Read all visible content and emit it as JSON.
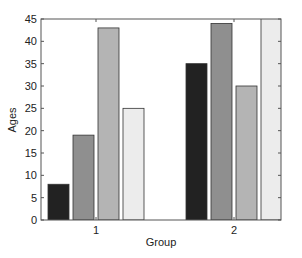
{
  "chart_data": {
    "type": "bar",
    "title": "",
    "xlabel": "Group",
    "ylabel": "Ages",
    "categories": [
      "1",
      "2"
    ],
    "series": [
      {
        "name": "Series 1",
        "values": [
          8,
          35
        ],
        "color": "#222222"
      },
      {
        "name": "Series 2",
        "values": [
          19,
          44
        ],
        "color": "#8f8f8f"
      },
      {
        "name": "Series 3",
        "values": [
          43,
          30
        ],
        "color": "#b4b4b4"
      },
      {
        "name": "Series 4",
        "values": [
          25,
          48
        ],
        "color": "#ececec"
      }
    ],
    "ylim": [
      0,
      45
    ],
    "yticks": [
      0,
      5,
      10,
      15,
      20,
      25,
      30,
      35,
      40,
      45
    ],
    "grid": false,
    "legend": null
  }
}
